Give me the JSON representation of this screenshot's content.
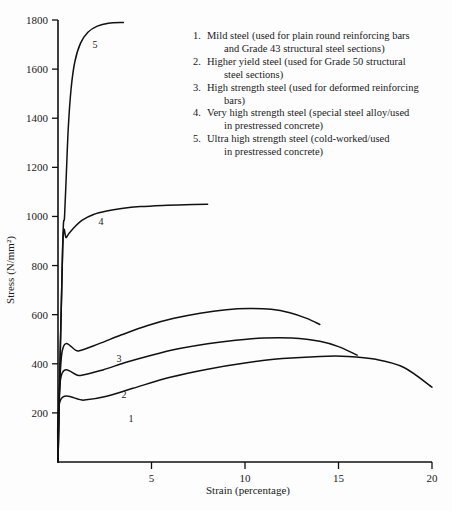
{
  "chart_data": {
    "type": "line",
    "title": "",
    "xlabel": "Strain (percentage)",
    "ylabel": "Stress (N/mm²)",
    "xlim": [
      0,
      20
    ],
    "ylim": [
      0,
      1800
    ],
    "xticks": [
      5,
      10,
      15,
      20
    ],
    "yticks": [
      200,
      400,
      600,
      800,
      1000,
      1200,
      1400,
      1600,
      1800
    ],
    "grid": false,
    "legend_position": "top-right-inside",
    "series": [
      {
        "name": "1",
        "label": "Mild steel",
        "yield_stress": 250,
        "ultimate_stress": 430,
        "failure_strain": 20,
        "points": [
          [
            0,
            0
          ],
          [
            0.12,
            250
          ],
          [
            1.4,
            252
          ],
          [
            2.6,
            268
          ],
          [
            4.0,
            300
          ],
          [
            6.0,
            345
          ],
          [
            8.0,
            378
          ],
          [
            10.0,
            403
          ],
          [
            12.0,
            421
          ],
          [
            14.0,
            430
          ],
          [
            15.5,
            430
          ],
          [
            17.0,
            418
          ],
          [
            18.5,
            385
          ],
          [
            20.0,
            305
          ]
        ]
      },
      {
        "name": "2",
        "label": "Higher yield steel",
        "yield_stress": 350,
        "ultimate_stress": 505,
        "failure_strain": 16,
        "points": [
          [
            0,
            0
          ],
          [
            0.17,
            350
          ],
          [
            1.2,
            352
          ],
          [
            2.4,
            375
          ],
          [
            3.6,
            405
          ],
          [
            5.0,
            435
          ],
          [
            6.5,
            462
          ],
          [
            8.0,
            482
          ],
          [
            9.5,
            496
          ],
          [
            11.0,
            505
          ],
          [
            12.5,
            505
          ],
          [
            14.0,
            492
          ],
          [
            15.0,
            470
          ],
          [
            16.0,
            435
          ]
        ]
      },
      {
        "name": "3",
        "label": "High strength steel",
        "yield_stress": 450,
        "ultimate_stress": 625,
        "failure_strain": 14,
        "points": [
          [
            0,
            0
          ],
          [
            0.22,
            450
          ],
          [
            1.1,
            452
          ],
          [
            2.2,
            482
          ],
          [
            3.4,
            518
          ],
          [
            4.8,
            556
          ],
          [
            6.2,
            585
          ],
          [
            7.6,
            606
          ],
          [
            9.0,
            620
          ],
          [
            10.2,
            625
          ],
          [
            11.4,
            622
          ],
          [
            12.4,
            608
          ],
          [
            13.3,
            585
          ],
          [
            14.0,
            560
          ]
        ]
      },
      {
        "name": "4",
        "label": "Very high strength steel",
        "yield_stress": 900,
        "ultimate_stress": 1050,
        "failure_strain": 8,
        "points": [
          [
            0,
            0
          ],
          [
            0.25,
            870
          ],
          [
            0.45,
            915
          ],
          [
            0.8,
            950
          ],
          [
            1.3,
            985
          ],
          [
            1.9,
            1008
          ],
          [
            2.6,
            1022
          ],
          [
            3.4,
            1032
          ],
          [
            4.4,
            1040
          ],
          [
            5.6,
            1045
          ],
          [
            6.8,
            1048
          ],
          [
            8.0,
            1050
          ]
        ]
      },
      {
        "name": "5",
        "label": "Ultra high strength steel",
        "yield_stress": 900,
        "ultimate_stress": 1790,
        "failure_strain": 3.5,
        "points": [
          [
            0,
            0
          ],
          [
            0.25,
            880
          ],
          [
            0.35,
            1000
          ],
          [
            0.45,
            1180
          ],
          [
            0.55,
            1360
          ],
          [
            0.7,
            1520
          ],
          [
            0.9,
            1630
          ],
          [
            1.2,
            1705
          ],
          [
            1.6,
            1750
          ],
          [
            2.1,
            1775
          ],
          [
            2.7,
            1787
          ],
          [
            3.5,
            1790
          ]
        ]
      }
    ]
  },
  "axes": {
    "y_title": "Stress (N/mm²)",
    "x_title": "Strain (percentage)",
    "y_tick_labels": [
      "1800",
      "1600",
      "1400",
      "1200",
      "1000",
      "800",
      "600",
      "400",
      "200"
    ],
    "x_tick_labels": [
      "5",
      "10",
      "15",
      "20"
    ]
  },
  "curve_labels": [
    {
      "id": "1",
      "text": "1"
    },
    {
      "id": "2",
      "text": "2"
    },
    {
      "id": "3",
      "text": "3"
    },
    {
      "id": "4",
      "text": "4"
    },
    {
      "id": "5",
      "text": "5"
    }
  ],
  "legend": {
    "items": [
      {
        "number": "1.",
        "line1": "Mild steel (used for plain round reinforcing bars",
        "line2": "and Grade 43 structural steel sections)"
      },
      {
        "number": "2.",
        "line1": "Higher yield steel (used for Grade 50 structural",
        "line2": "steel sections)"
      },
      {
        "number": "3.",
        "line1": "High strength steel (used for deformed reinforcing",
        "line2": "bars)"
      },
      {
        "number": "4.",
        "line1": "Very high strength steel (special steel alloy/used",
        "line2": "in prestressed concrete)"
      },
      {
        "number": "5.",
        "line1": "Ultra high strength steel (cold-worked/used",
        "line2": "in prestressed concrete)"
      }
    ]
  },
  "colors": {
    "background": "#fdfdfd",
    "ink": "#111111",
    "curve": "#111111"
  }
}
